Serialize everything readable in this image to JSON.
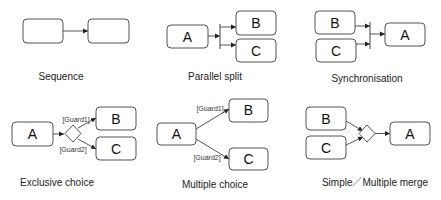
{
  "patterns": {
    "sequence": {
      "caption": "Sequence",
      "box1": "",
      "box2": ""
    },
    "parallel_split": {
      "caption": "Parallel split",
      "a": "A",
      "b": "B",
      "c": "C"
    },
    "synchronisation": {
      "caption": "Synchronisation",
      "a": "A",
      "b": "B",
      "c": "C"
    },
    "exclusive_choice": {
      "caption": "Exclusive choice",
      "a": "A",
      "b": "B",
      "c": "C",
      "guard1": "[Guard1]",
      "guard2": "[Guard2]"
    },
    "multiple_choice": {
      "caption": "Multiple choice",
      "a": "A",
      "b": "B",
      "c": "C",
      "guard1": "[Guard1]",
      "guard2": "[Guard2]"
    },
    "merge": {
      "caption": "Simple／Multiple merge",
      "a": "A",
      "b": "B",
      "c": "C"
    }
  },
  "colors": {
    "stroke": "#555555",
    "text": "#111111",
    "background": "#ffffff"
  }
}
